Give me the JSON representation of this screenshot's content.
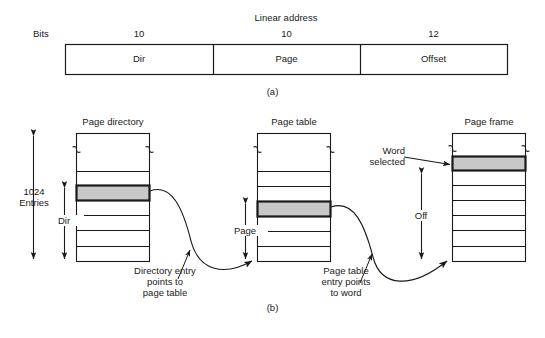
{
  "figure": {
    "part_a": {
      "title": "Linear address",
      "bits_label": "Bits",
      "fields": [
        {
          "name": "Dir",
          "bits": "10"
        },
        {
          "name": "Page",
          "bits": "10"
        },
        {
          "name": "Offset",
          "bits": "12"
        }
      ],
      "caption": "(a)"
    },
    "part_b": {
      "caption": "(b)",
      "tables": [
        {
          "title": "Page directory",
          "entries_label": "1024\nEntries",
          "index_label": "Dir"
        },
        {
          "title": "Page table",
          "index_label": "Page"
        },
        {
          "title": "Page frame",
          "index_label": "Off",
          "callout": "Word\nselected"
        }
      ],
      "connectors": [
        {
          "text": "Directory entry\npoints to\npage table"
        },
        {
          "text": "Page table\nentry points\nto word"
        }
      ]
    }
  },
  "colors": {
    "line": "#1a1a1a",
    "highlight_fill": "#c8c8c8",
    "background": "#ffffff"
  }
}
